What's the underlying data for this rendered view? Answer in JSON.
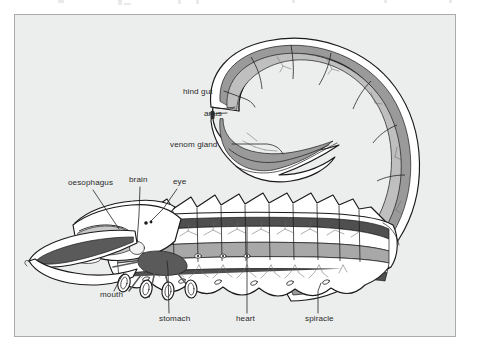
{
  "figure": {
    "caption": "",
    "panel": {
      "background_color": "#eceded",
      "border_color": "#a9abac"
    },
    "palette": {
      "outline": "#1a1a1a",
      "body_fill": "#ffffff",
      "dark_band": "#4f4f4f",
      "mid_gray": "#9a9a9a",
      "light_gray": "#c4c4c4",
      "label_text": "#2b2b2b",
      "leader_line": "#232323"
    },
    "labels": [
      {
        "id": "hind-gut",
        "text": "hind gut",
        "x": 168,
        "y": 79,
        "anchor": "start"
      },
      {
        "id": "anus",
        "text": "anus",
        "x": 189,
        "y": 101,
        "anchor": "start"
      },
      {
        "id": "venom-gland",
        "text": "venom gland",
        "x": 155,
        "y": 132,
        "anchor": "start"
      },
      {
        "id": "oesophagus",
        "text": "oesophagus",
        "x": 53,
        "y": 170,
        "anchor": "start"
      },
      {
        "id": "brain",
        "text": "brain",
        "x": 114,
        "y": 167,
        "anchor": "start"
      },
      {
        "id": "eye",
        "text": "eye",
        "x": 158,
        "y": 169,
        "anchor": "start"
      },
      {
        "id": "mouth",
        "text": "mouth",
        "x": 85,
        "y": 282,
        "anchor": "start"
      },
      {
        "id": "stomach",
        "text": "stomach",
        "x": 144,
        "y": 306,
        "anchor": "start"
      },
      {
        "id": "heart",
        "text": "heart",
        "x": 221,
        "y": 306,
        "anchor": "start"
      },
      {
        "id": "spiracle",
        "text": "spiracle",
        "x": 290,
        "y": 306,
        "anchor": "start"
      }
    ],
    "structures": [
      "metasoma (tail)",
      "telson with sting",
      "venom gland",
      "hind gut",
      "anus",
      "mesosoma (abdomen)",
      "heart (dorsal vessel)",
      "midgut",
      "spiracles",
      "cephalothorax",
      "brain",
      "oesophagus",
      "stomach",
      "mouth",
      "median eyes",
      "pedipalp / chela",
      "walking legs"
    ]
  }
}
